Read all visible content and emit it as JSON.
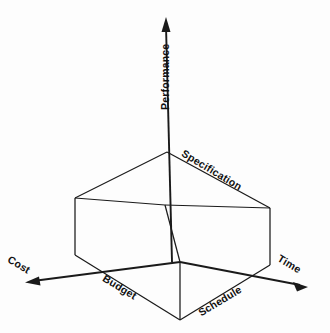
{
  "diagram": {
    "type": "3d-axes-cube-diagram",
    "background_color": "#fdfdfd",
    "line_color": "#1a1a1a",
    "axes": [
      {
        "id": "performance",
        "label": "Performance",
        "direction": "up",
        "has_arrow": true,
        "rotation_deg": -90
      },
      {
        "id": "cost",
        "label": "Cost",
        "direction": "down-left",
        "has_arrow": true,
        "rotation_deg": 31
      },
      {
        "id": "time",
        "label": "Time",
        "direction": "down-right",
        "has_arrow": true,
        "rotation_deg": 31
      }
    ],
    "edge_labels": [
      {
        "id": "specification",
        "label": "Specification",
        "edge": "top-face-right",
        "rotation_deg": 31
      },
      {
        "id": "budget",
        "label": "Budget",
        "edge": "bottom-face-front-left",
        "rotation_deg": 31
      },
      {
        "id": "schedule",
        "label": "Schedule",
        "edge": "bottom-face-front-right",
        "rotation_deg": -31
      }
    ],
    "geometry": {
      "origin": {
        "x": 180,
        "y": 262
      },
      "top_face": [
        {
          "x": 75,
          "y": 198
        },
        {
          "x": 167,
          "y": 152
        },
        {
          "x": 270,
          "y": 208
        },
        {
          "x": 165,
          "y": 205
        }
      ],
      "vertical_edges": [
        {
          "x": 75,
          "y1": 198,
          "y2": 255
        },
        {
          "x": 180,
          "y1": 262,
          "y2": 320
        },
        {
          "x": 270,
          "y1": 208,
          "y2": 265
        }
      ],
      "bottom_front_edges": [
        {
          "x1": 75,
          "y1": 255,
          "x2": 180,
          "y2": 320
        },
        {
          "x1": 180,
          "y1": 320,
          "x2": 270,
          "y2": 265
        }
      ],
      "performance_axis": {
        "x": 166,
        "y_tip": 18,
        "y_base": 262
      },
      "cost_axis": {
        "x1": 180,
        "y1": 262,
        "x2": 28,
        "y2": 282
      },
      "time_axis": {
        "x1": 180,
        "y1": 262,
        "x2": 305,
        "y2": 288
      }
    }
  }
}
